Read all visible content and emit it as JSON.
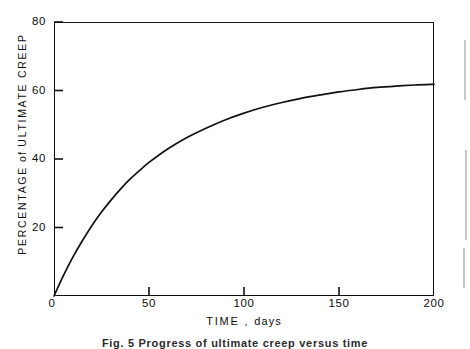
{
  "figure": {
    "caption": "Fig. 5 Progress of ultimate creep versus time"
  },
  "axes": {
    "y_title_main": "PERCENTAGE",
    "y_title_lower": "of",
    "y_title_tail": "ULTIMATE CREEP",
    "y_title_full": "PERCENTAGE of ULTIMATE CREEP",
    "x_title_main": "TIME",
    "x_title_sep": ",",
    "x_title_lower": "days",
    "x_title_full": "TIME , days",
    "y_ticks": [
      "0",
      "20",
      "40",
      "60",
      "80"
    ],
    "x_ticks": [
      "0",
      "50",
      "100",
      "150",
      "200"
    ]
  },
  "chart_data": {
    "type": "line",
    "title": "Fig. 5 Progress of ultimate creep versus time",
    "xlabel": "TIME , days",
    "ylabel": "PERCENTAGE of ULTIMATE CREEP",
    "xlim": [
      0,
      200
    ],
    "ylim": [
      0,
      80
    ],
    "xticks": [
      0,
      50,
      100,
      150,
      200
    ],
    "yticks": [
      0,
      20,
      40,
      60,
      80
    ],
    "grid": false,
    "legend": null,
    "line_color": "#111111",
    "series": [
      {
        "name": "Percentage of ultimate creep",
        "x": [
          0,
          5,
          10,
          15,
          20,
          25,
          30,
          35,
          40,
          45,
          50,
          60,
          70,
          80,
          90,
          100,
          110,
          120,
          130,
          140,
          150,
          160,
          170,
          180,
          190,
          200
        ],
        "values": [
          0,
          6.0,
          11.4,
          16.2,
          20.6,
          24.5,
          28.0,
          31.2,
          34.1,
          36.6,
          39.0,
          43.0,
          46.3,
          49.0,
          51.4,
          53.4,
          55.1,
          56.5,
          57.7,
          58.7,
          59.6,
          60.3,
          60.9,
          61.3,
          61.6,
          61.8
        ]
      }
    ]
  }
}
